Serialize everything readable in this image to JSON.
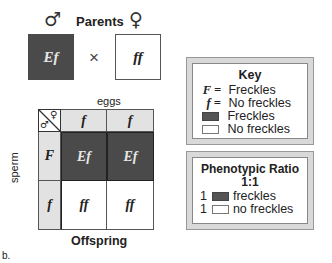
{
  "parents": {
    "title": "Parents",
    "male_symbol": "♂",
    "female_symbol": "♀",
    "cross_symbol": "×",
    "male_genotype": "Ef",
    "female_genotype": "ff"
  },
  "punnett": {
    "eggs_label": "eggs",
    "sperm_label": "sperm",
    "offspring_label": "Offspring",
    "corner_symbols": {
      "male": "♂",
      "female": "♀"
    },
    "egg_alleles": [
      "f",
      "f"
    ],
    "sperm_alleles": [
      "F",
      "f"
    ],
    "cells": [
      [
        "Ef",
        "Ef"
      ],
      [
        "ff",
        "ff"
      ]
    ]
  },
  "key": {
    "title": "Key",
    "entries": [
      {
        "symbol": "F =",
        "label": "Freckles"
      },
      {
        "symbol": "f =",
        "label": "No freckles"
      },
      {
        "swatch": "dark",
        "label": "Freckles"
      },
      {
        "swatch": "light",
        "label": "No freckles"
      }
    ]
  },
  "ratio": {
    "title": "Phenotypic Ratio",
    "value": "1:1",
    "entries": [
      {
        "count": "1",
        "swatch": "dark",
        "label": "freckles"
      },
      {
        "count": "1",
        "swatch": "light",
        "label": "no freckles"
      }
    ]
  },
  "figure_label": "b.",
  "colors": {
    "dark": "#4a4a4a",
    "header": "#e2e2e2",
    "panel": "#d9d9d9"
  }
}
